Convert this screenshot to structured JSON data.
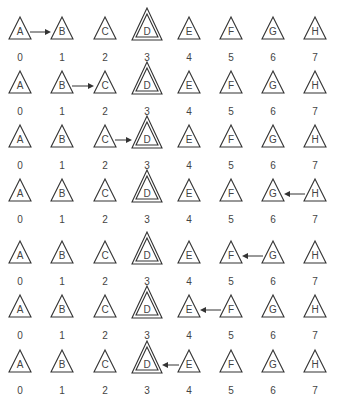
{
  "diagram": {
    "columns_x": [
      20,
      62,
      105,
      147,
      189,
      231,
      273,
      315
    ],
    "target_index": 3,
    "rows": [
      {
        "y": 14,
        "nodes": [
          "A",
          "B",
          "C",
          "D",
          "E",
          "F",
          "G",
          "H"
        ],
        "indices": [
          "0",
          "1",
          "2",
          "3",
          "4",
          "5",
          "6",
          "7"
        ],
        "arrow": {
          "from": 0,
          "to": 1
        }
      },
      {
        "y": 68,
        "nodes": [
          "A",
          "B",
          "C",
          "D",
          "E",
          "F",
          "G",
          "H"
        ],
        "indices": [
          "0",
          "1",
          "2",
          "3",
          "4",
          "5",
          "6",
          "7"
        ],
        "arrow": {
          "from": 1,
          "to": 2
        }
      },
      {
        "y": 122,
        "nodes": [
          "A",
          "B",
          "C",
          "D",
          "E",
          "F",
          "G",
          "H"
        ],
        "indices": [
          "0",
          "1",
          "2",
          "3",
          "4",
          "5",
          "6",
          "7"
        ],
        "arrow": {
          "from": 2,
          "to": 3
        }
      },
      {
        "y": 176,
        "nodes": [
          "A",
          "B",
          "C",
          "D",
          "E",
          "F",
          "G",
          "H"
        ],
        "indices": [
          "0",
          "1",
          "2",
          "3",
          "4",
          "5",
          "6",
          "7"
        ],
        "arrow": {
          "from": 7,
          "to": 6
        }
      },
      {
        "y": 238,
        "nodes": [
          "A",
          "B",
          "C",
          "D",
          "E",
          "F",
          "G",
          "H"
        ],
        "indices": [
          "0",
          "1",
          "2",
          "3",
          "4",
          "5",
          "6",
          "7"
        ],
        "arrow": {
          "from": 6,
          "to": 5
        }
      },
      {
        "y": 292,
        "nodes": [
          "A",
          "B",
          "C",
          "D",
          "E",
          "F",
          "G",
          "H"
        ],
        "indices": [
          "0",
          "1",
          "2",
          "3",
          "4",
          "5",
          "6",
          "7"
        ],
        "arrow": {
          "from": 5,
          "to": 4
        }
      },
      {
        "y": 347,
        "nodes": [
          "A",
          "B",
          "C",
          "D",
          "E",
          "F",
          "G",
          "H"
        ],
        "indices": [
          "0",
          "1",
          "2",
          "3",
          "4",
          "5",
          "6",
          "7"
        ],
        "arrow": {
          "from": 4,
          "to": 3
        }
      }
    ],
    "colors": {
      "stroke": "#333333",
      "text": "#444444",
      "background": "#ffffff"
    }
  }
}
